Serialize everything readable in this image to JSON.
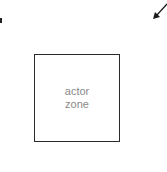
{
  "diagram": {
    "zone": {
      "label": "actor zone",
      "border_color": "#2a2a2a",
      "text_color": "#8a8a8a"
    },
    "arrow": {
      "direction": "down-left",
      "color": "#1a1a1a"
    }
  }
}
